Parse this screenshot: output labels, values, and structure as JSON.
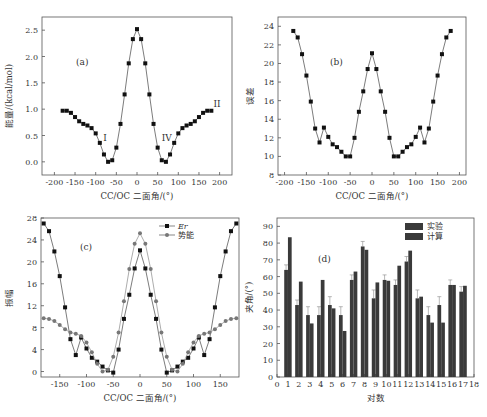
{
  "chart_data": [
    {
      "id": "a",
      "type": "line",
      "panel_label": "(a)",
      "title": "",
      "xlabel": "CC/OC 二面角/(°)",
      "ylabel": "能量/(kcal/mol)",
      "xlim": [
        -230,
        230
      ],
      "ylim": [
        -0.25,
        2.75
      ],
      "xticks": [
        -200,
        -150,
        -100,
        -50,
        0,
        50,
        100,
        150,
        200
      ],
      "yticks": [
        "0.0",
        "0.5",
        "1.0",
        "1.5",
        "2.0",
        "2.5"
      ],
      "grid": false,
      "annotations": [
        {
          "text": "I",
          "x": -82,
          "y": 0.4
        },
        {
          "text": "IV",
          "x": 60,
          "y": 0.4
        },
        {
          "text": "II",
          "x": 185,
          "y": 1.05
        }
      ],
      "x": [
        -180,
        -170,
        -160,
        -150,
        -140,
        -130,
        -120,
        -110,
        -100,
        -90,
        -80,
        -70,
        -60,
        -50,
        -40,
        -30,
        -20,
        -10,
        0,
        10,
        20,
        30,
        40,
        50,
        60,
        70,
        80,
        90,
        100,
        110,
        120,
        130,
        140,
        150,
        160,
        170,
        180
      ],
      "series": [
        {
          "name": "能量",
          "marker": "square",
          "color": "#111111",
          "values": [
            0.97,
            0.97,
            0.93,
            0.85,
            0.77,
            0.72,
            0.69,
            0.64,
            0.54,
            0.36,
            0.14,
            0.0,
            0.03,
            0.27,
            0.72,
            1.28,
            1.87,
            2.33,
            2.52,
            2.33,
            1.87,
            1.28,
            0.72,
            0.27,
            0.03,
            0.0,
            0.14,
            0.36,
            0.54,
            0.64,
            0.69,
            0.72,
            0.77,
            0.85,
            0.93,
            0.97,
            0.97
          ]
        }
      ]
    },
    {
      "id": "b",
      "type": "line",
      "panel_label": "(b)",
      "title": "",
      "xlabel": "CC/OC 二面角/(°)",
      "ylabel": "误差",
      "xlim": [
        -215,
        215
      ],
      "ylim": [
        8,
        25
      ],
      "xticks": [
        -200,
        -150,
        -100,
        -50,
        0,
        50,
        100,
        150,
        200
      ],
      "yticks": [
        8,
        10,
        12,
        14,
        16,
        18,
        20,
        22,
        24
      ],
      "grid": false,
      "x": [
        -180,
        -170,
        -160,
        -150,
        -140,
        -130,
        -120,
        -110,
        -100,
        -90,
        -80,
        -70,
        -60,
        -50,
        -40,
        -30,
        -20,
        -10,
        0,
        10,
        20,
        30,
        40,
        50,
        60,
        70,
        80,
        90,
        100,
        110,
        120,
        130,
        140,
        150,
        160,
        170,
        180
      ],
      "series": [
        {
          "name": "误差",
          "marker": "square",
          "color": "#111111",
          "values": [
            23.5,
            22.8,
            21.0,
            18.7,
            15.9,
            13.0,
            11.5,
            13.1,
            12.1,
            11.3,
            11.0,
            10.5,
            10.0,
            10.0,
            12.0,
            14.8,
            17.0,
            19.4,
            21.1,
            19.4,
            17.0,
            14.8,
            12.0,
            10.0,
            10.0,
            10.5,
            11.0,
            11.3,
            12.1,
            13.1,
            11.5,
            13.0,
            15.9,
            18.7,
            21.0,
            22.8,
            23.5
          ]
        }
      ]
    },
    {
      "id": "c",
      "type": "line",
      "panel_label": "(c)",
      "title": "",
      "xlabel": "CC/OC 二面角/(°)",
      "ylabel": "振幅",
      "xlim": [
        -185,
        185
      ],
      "ylim": [
        -1,
        28
      ],
      "xticks": [
        -150,
        -100,
        -50,
        0,
        50,
        100,
        150
      ],
      "yticks": [
        0,
        4,
        8,
        12,
        16,
        20,
        24,
        28
      ],
      "grid": false,
      "legend": {
        "position": "top-right",
        "entries": [
          "Er",
          "势能"
        ]
      },
      "x": [
        -180,
        -170,
        -160,
        -150,
        -140,
        -130,
        -120,
        -110,
        -100,
        -90,
        -80,
        -70,
        -60,
        -50,
        -40,
        -30,
        -20,
        -10,
        0,
        10,
        20,
        30,
        40,
        50,
        60,
        70,
        80,
        90,
        100,
        110,
        120,
        130,
        140,
        150,
        160,
        170,
        180
      ],
      "series": [
        {
          "name": "Er",
          "marker": "square",
          "color": "#111111",
          "values": [
            27.0,
            25.6,
            21.9,
            17.4,
            11.7,
            5.9,
            3.0,
            6.2,
            4.2,
            2.5,
            1.8,
            0.9,
            0.2,
            -0.2,
            4.0,
            9.6,
            14.0,
            18.8,
            22.1,
            18.8,
            14.0,
            9.6,
            4.0,
            -0.2,
            0.2,
            0.9,
            1.8,
            2.5,
            4.2,
            6.2,
            3.0,
            5.9,
            11.7,
            17.4,
            21.9,
            25.6,
            27.0
          ]
        },
        {
          "name": "势能",
          "marker": "circle",
          "color": "#777777",
          "values": [
            9.7,
            9.6,
            9.2,
            8.5,
            7.7,
            7.1,
            6.9,
            6.5,
            5.3,
            3.5,
            1.4,
            0.0,
            0.3,
            2.7,
            7.1,
            12.8,
            18.7,
            23.3,
            25.2,
            23.3,
            18.7,
            12.8,
            7.1,
            2.7,
            0.3,
            0.0,
            1.4,
            3.5,
            5.3,
            6.5,
            6.9,
            7.1,
            7.7,
            8.5,
            9.2,
            9.6,
            9.7
          ]
        }
      ]
    },
    {
      "id": "d",
      "type": "bar",
      "panel_label": "(d)",
      "title": "",
      "xlabel": "对数",
      "ylabel": "夹角/(°)",
      "xlim": [
        0,
        18
      ],
      "ylim": [
        0,
        95
      ],
      "xticks": [
        0,
        1,
        2,
        3,
        4,
        5,
        6,
        7,
        8,
        9,
        10,
        11,
        12,
        13,
        14,
        15,
        16,
        17,
        18
      ],
      "yticks": [
        0,
        10,
        20,
        30,
        40,
        50,
        60,
        70,
        80,
        90
      ],
      "grid": false,
      "legend": {
        "position": "top-right",
        "entries": [
          "实验",
          "计算"
        ]
      },
      "categories": [
        1,
        2,
        3,
        4,
        5,
        6,
        7,
        8,
        9,
        10,
        11,
        12,
        13,
        14,
        15,
        16,
        17
      ],
      "series": [
        {
          "name": "实验",
          "color": "#3a3a3a",
          "error": 3,
          "values": [
            64,
            43,
            37,
            37,
            43,
            37,
            58,
            78,
            47,
            58,
            55,
            69,
            47,
            37,
            43,
            55,
            51
          ],
          "errors": [
            3,
            3,
            5,
            5,
            5,
            5,
            3,
            3,
            5,
            3,
            3,
            3,
            5,
            5,
            5,
            3,
            3
          ]
        },
        {
          "name": "计算",
          "color": "#3a3a3a",
          "values": [
            83.5,
            57,
            32,
            58,
            41,
            27.5,
            63,
            76,
            56.5,
            57.5,
            66.5,
            75.5,
            48,
            32.5,
            32.5,
            55,
            54.5
          ]
        }
      ]
    }
  ],
  "caption": "图 … 不同构型的二面角能量、误差、振幅及夹角比较"
}
